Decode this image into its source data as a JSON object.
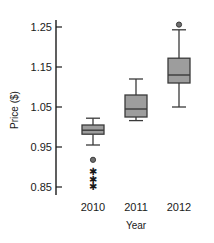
{
  "chart_data": {
    "type": "box",
    "title": "",
    "xlabel": "Year",
    "ylabel": "Price ($)",
    "categories": [
      "2010",
      "2011",
      "2012"
    ],
    "ylim": [
      0.85,
      1.28
    ],
    "yticks": [
      0.85,
      0.95,
      1.05,
      1.15,
      1.25
    ],
    "ytick_labels": [
      "0.85",
      "0.95",
      "1.05",
      "1.15",
      "1.25"
    ],
    "grid": false,
    "legend": "none",
    "box_fill_color": "#9d9d9d",
    "box_line_color": "#3a3a3a",
    "boxes": [
      {
        "category": "2010",
        "whisker_low": 0.955,
        "q1": 0.982,
        "median": 0.992,
        "q3": 1.005,
        "whisker_high": 1.022,
        "outliers_circle": [
          0.918
        ],
        "outliers_star": [
          0.888,
          0.868,
          0.85
        ]
      },
      {
        "category": "2011",
        "whisker_low": 1.016,
        "q1": 1.025,
        "median": 1.045,
        "q3": 1.08,
        "whisker_high": 1.12,
        "outliers_circle": [],
        "outliers_star": []
      },
      {
        "category": "2012",
        "whisker_low": 1.05,
        "q1": 1.11,
        "median": 1.13,
        "q3": 1.172,
        "whisker_high": 1.243,
        "outliers_circle": [
          1.256
        ],
        "outliers_star": []
      }
    ]
  }
}
